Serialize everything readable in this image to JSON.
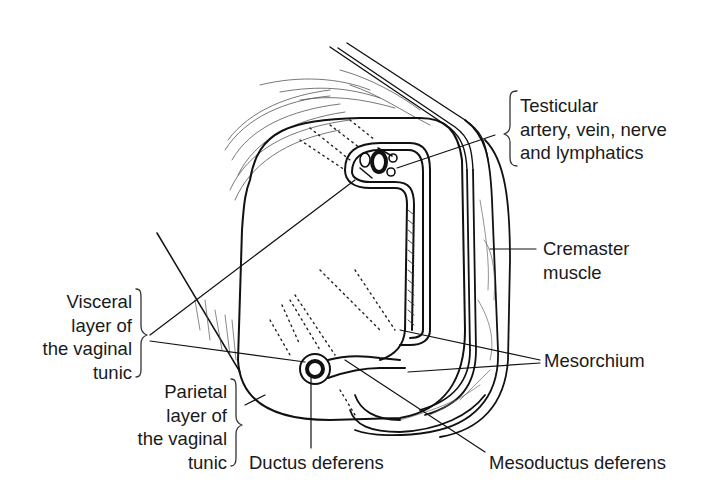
{
  "diagram": {
    "type": "anatomical line drawing",
    "labels": {
      "testicular": [
        "Testicular",
        "artery, vein, nerve",
        "and lymphatics"
      ],
      "cremaster": [
        "Cremaster",
        "muscle"
      ],
      "visceral": [
        "Visceral",
        "layer of",
        "the vaginal",
        "tunic"
      ],
      "mesorchium": [
        "Mesorchium"
      ],
      "parietal": [
        "Parietal",
        "layer of",
        "the vaginal",
        "tunic"
      ],
      "ductus": [
        "Ductus deferens"
      ],
      "mesoductus": [
        "Mesoductus deferens"
      ]
    },
    "colors": {
      "line": "#111111",
      "text": "#1a1a1a",
      "background": "#ffffff"
    }
  }
}
